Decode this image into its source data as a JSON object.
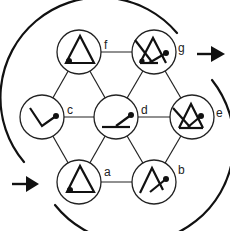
{
  "diagram": {
    "type": "hexagonal state graph",
    "nodes": [
      {
        "id": "f",
        "label": "f",
        "glyph": "closed-triangle-with-corner-dot"
      },
      {
        "id": "g",
        "label": "g",
        "glyph": "triangle-with-crossing-stroke-and-dot"
      },
      {
        "id": "c",
        "label": "c",
        "glyph": "v-angle-with-dot"
      },
      {
        "id": "d",
        "label": "d",
        "glyph": "flat-line-with-raised-stroke-and-dot"
      },
      {
        "id": "e",
        "label": "e",
        "glyph": "triangle-with-crossing-stroke-and-dot"
      },
      {
        "id": "a",
        "label": "a",
        "glyph": "closed-triangle-with-corner-dot"
      },
      {
        "id": "b",
        "label": "b",
        "glyph": "open-peak-with-crossing-stroke-and-dot"
      }
    ],
    "edges": [
      [
        "f",
        "g"
      ],
      [
        "f",
        "c"
      ],
      [
        "f",
        "d"
      ],
      [
        "g",
        "d"
      ],
      [
        "g",
        "e"
      ],
      [
        "c",
        "d"
      ],
      [
        "d",
        "e"
      ],
      [
        "c",
        "a"
      ],
      [
        "d",
        "a"
      ],
      [
        "d",
        "b"
      ],
      [
        "e",
        "b"
      ],
      [
        "a",
        "b"
      ]
    ],
    "arrows": [
      {
        "name": "input-arrow",
        "direction": "right",
        "position": "bottom-left"
      },
      {
        "name": "output-arrow",
        "direction": "right",
        "position": "top-right"
      }
    ],
    "colors": {
      "ink": "#111111",
      "background": "#ffffff"
    }
  }
}
